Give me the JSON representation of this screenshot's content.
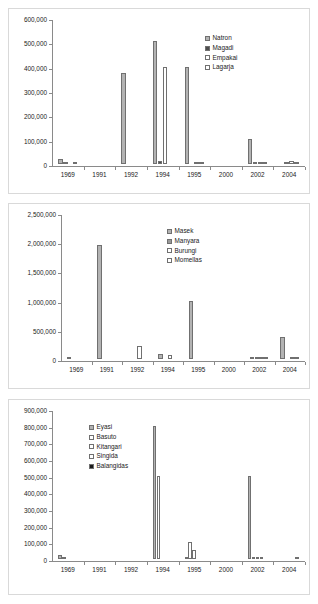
{
  "page": {
    "background": "#ffffff",
    "width": 318,
    "height": 604
  },
  "palette": {
    "series_light_gray": "#b3b3b3",
    "series_mid_gray": "#9a9a9a",
    "series_white": "#ffffff",
    "series_black": "#1a1a1a",
    "bar_outline": "#707070",
    "axis": "#8a8a8a",
    "panel_border": "#d9d9d9",
    "text": "#1a1a1a"
  },
  "charts": [
    {
      "id": "chart-natron-magadi-empakai-lagarja",
      "type": "bar",
      "title": "",
      "xlabel": "",
      "ylabel": "",
      "ylim": [
        0,
        600000
      ],
      "yticks": [
        "0",
        "100,000",
        "200,000",
        "300,000",
        "400,000",
        "500,000",
        "600,000"
      ],
      "ytick_values": [
        0,
        100000,
        200000,
        300000,
        400000,
        500000,
        600000
      ],
      "grid": false,
      "legend_position": "top-right",
      "categories": [
        "1969",
        "1991",
        "1992",
        "1994",
        "1995",
        "2000",
        "2002",
        "2004"
      ],
      "series": [
        {
          "name": "Natron",
          "color": "#b3b3b3",
          "values": [
            22000,
            0,
            372000,
            505000,
            400000,
            0,
            101000,
            0
          ]
        },
        {
          "name": "Magadi",
          "color": "#4d4d4d",
          "values": [
            5000,
            0,
            0,
            12000,
            0,
            0,
            2000,
            4000
          ]
        },
        {
          "name": "Empakai",
          "color": "#ffffff",
          "values": [
            0,
            0,
            0,
            400000,
            3000,
            0,
            1500,
            14000
          ]
        },
        {
          "name": "Lagarja",
          "color": "#ffffff",
          "values": [
            3000,
            0,
            0,
            0,
            1500,
            0,
            1000,
            1000
          ]
        }
      ]
    },
    {
      "id": "chart-masek-manyara-burungi-momellas",
      "type": "bar",
      "title": "",
      "xlabel": "",
      "ylabel": "",
      "ylim": [
        0,
        2500000
      ],
      "yticks": [
        "0",
        "500,000",
        "1,000,000",
        "1,500,000",
        "2,000,000",
        "2,500,000"
      ],
      "ytick_values": [
        0,
        500000,
        1000000,
        1500000,
        2000000,
        2500000
      ],
      "grid": false,
      "legend_position": "top-center",
      "categories": [
        "1969",
        "1991",
        "1992",
        "1994",
        "1995",
        "2000",
        "2002",
        "2004"
      ],
      "series": [
        {
          "name": "Masek",
          "color": "#b3b3b3",
          "values": [
            4000,
            1950000,
            0,
            80000,
            1000000,
            0,
            10000,
            385000
          ]
        },
        {
          "name": "Manyara",
          "color": "#9a9a9a",
          "values": [
            0,
            0,
            0,
            0,
            0,
            0,
            12000,
            0
          ]
        },
        {
          "name": "Burungi",
          "color": "#ffffff",
          "values": [
            0,
            0,
            225000,
            70000,
            0,
            0,
            5000,
            8000
          ]
        },
        {
          "name": "Momellas",
          "color": "#ffffff",
          "values": [
            0,
            0,
            0,
            0,
            0,
            0,
            2000,
            3000
          ]
        }
      ]
    },
    {
      "id": "chart-eyasi-basuto-kitangari-singida-balangidas",
      "type": "bar",
      "title": "",
      "xlabel": "",
      "ylabel": "",
      "ylim": [
        0,
        900000
      ],
      "yticks": [
        "0",
        "100,000",
        "200,000",
        "300,000",
        "400,000",
        "500,000",
        "600,000",
        "700,000",
        "800,000",
        "900,000"
      ],
      "ytick_values": [
        0,
        100000,
        200000,
        300000,
        400000,
        500000,
        600000,
        700000,
        800000,
        900000
      ],
      "grid": false,
      "legend_position": "top-left",
      "categories": [
        "1969",
        "1991",
        "1992",
        "1994",
        "1995",
        "2000",
        "2002",
        "2004"
      ],
      "series": [
        {
          "name": "Eyasi",
          "color": "#b3b3b3",
          "values": [
            22000,
            0,
            0,
            800000,
            12000,
            0,
            500000,
            0
          ]
        },
        {
          "name": "Basuto",
          "color": "#ffffff",
          "values": [
            4000,
            0,
            0,
            500000,
            100000,
            0,
            3000,
            0
          ]
        },
        {
          "name": "Kitangari",
          "color": "#ffffff",
          "values": [
            0,
            0,
            0,
            0,
            52000,
            0,
            2000,
            0
          ]
        },
        {
          "name": "Singida",
          "color": "#ffffff",
          "values": [
            0,
            0,
            0,
            0,
            0,
            0,
            1000,
            0
          ]
        },
        {
          "name": "Balangidas",
          "color": "#1a1a1a",
          "values": [
            0,
            0,
            0,
            0,
            0,
            0,
            0,
            13000
          ]
        }
      ]
    }
  ]
}
